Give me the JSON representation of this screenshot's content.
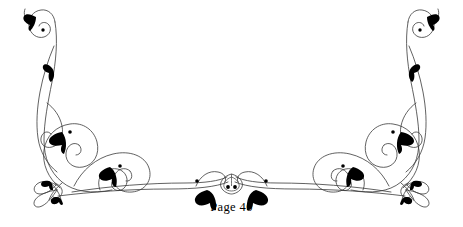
{
  "document": {
    "page_label": "Page 40",
    "background_color": "#ffffff",
    "ink_color": "#000000",
    "stroke_color": "#3a3a3a"
  },
  "ornament": {
    "name": "symmetric-calligraphic-tailpiece",
    "description": "Mirrored pen-flourish page ornament with scrolled uprights, interlocking loops, bow knots and leaf accents",
    "symmetry": "bilateral-vertical-axis",
    "axis_x": 231.5,
    "elements": {
      "left_upright_scroll": "spiral-terminal",
      "right_upright_scroll": "spiral-terminal",
      "left_bow_knot": "ribbon-bow",
      "right_bow_knot": "ribbon-bow",
      "center_motif": "trefoil-knot",
      "baseline": "sweeping-horizontal-flourish"
    },
    "leaf_count": 16,
    "dot_count": 10
  }
}
